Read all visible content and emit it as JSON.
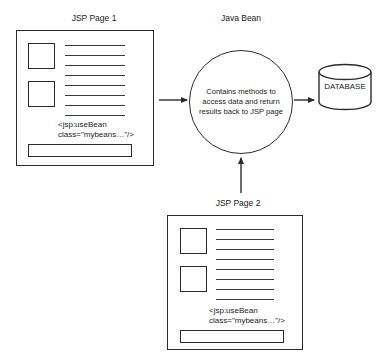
{
  "diagram": {
    "type": "flow-diagram",
    "title_jsp1": "JSP Page 1",
    "title_bean": "Java Bean",
    "title_jsp2": "JSP Page 2",
    "bean_body": "Contains methods to access data and return results back to JSP page",
    "database_label": "DATABASE",
    "code_line_1": "<jsp:useBean",
    "code_line_2": "class=\"mybeans…\"/>",
    "stroke_color": "#2b2b2b",
    "background_color": "#ffffff",
    "text_color": "#1a1a1a",
    "content_rule_count": 8,
    "thumb_count_per_page": 2,
    "arrows": [
      {
        "name": "jsp1-to-bean",
        "direction": "right"
      },
      {
        "name": "bean-to-database",
        "direction": "right"
      },
      {
        "name": "jsp2-to-bean",
        "direction": "up"
      }
    ]
  }
}
